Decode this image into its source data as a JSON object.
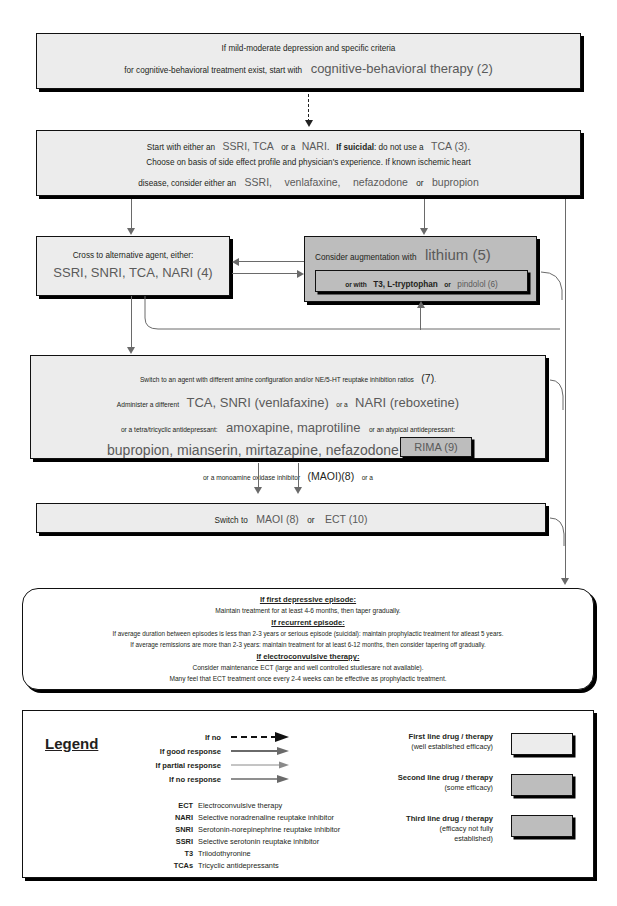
{
  "document": {
    "top_fragment": "",
    "title": "Algorithm for treatment of depression"
  },
  "nodes": {
    "cbt": {
      "id": "cbt-box",
      "tier": "first-line",
      "line1": "If mild-moderate depression and specific criteria",
      "line2_pre": "for cognitive-behavioral treatment exist, start with",
      "line2_emph": "cognitive-behavioral therapy (2)"
    },
    "start": {
      "id": "start-box",
      "tier": "first-line",
      "l1_a": "Start with either an",
      "l1_b": "SSRI, TCA",
      "l1_c": "or a",
      "l1_d": "NARI.",
      "l1_e": "If suicidal",
      "l1_f": ": do not use a",
      "l1_g": "TCA (3).",
      "l2": "Choose on basis of side effect profile and physician's experience. If known ischemic heart",
      "l3_a": "disease, consider either an",
      "l3_b": "SSRI,",
      "l3_c": "venlafaxine,",
      "l3_d": "nefazodone",
      "l3_e": "or",
      "l3_f": "bupropion"
    },
    "cross": {
      "id": "cross-box",
      "tier": "first-line",
      "l1": "Cross to alternative agent, either:",
      "l2": "SSRI, SNRI, TCA, NARI (4)"
    },
    "lithium": {
      "id": "lithium-box",
      "tier": "second-line",
      "l1_a": "Consider augmentation with",
      "l1_b": "lithium (5)",
      "inner": {
        "id": "lithium-inner-box",
        "tier": "third-line",
        "a": "or with",
        "b": "T3, L-tryptophan",
        "c": "or",
        "d": "pindolol (6)"
      }
    },
    "switch": {
      "id": "switch-box",
      "tier": "first-line",
      "l1_a": "Switch to an agent with different amine configuration and/or NE/5-HT reuptake inhibition ratios",
      "l1_b": "(7)",
      "l1_c": ".",
      "l2_a": "Administer a different",
      "l2_b": "TCA, SNRI (venlafaxine)",
      "l2_c": "or a",
      "l2_d": "NARI (reboxetine)",
      "l3_a": "or a tetra/tricyclic antidepressant:",
      "l3_b": "amoxapine, maprotiline",
      "l3_c": "or an atypical antidepressant:",
      "l4": "bupropion, mianserin, mirtazapine, nefazodone, trazodone",
      "l5_a": "or a monoamine oxidase inhibitor",
      "l5_b": "(MAOI)(8)",
      "l5_c": "or a",
      "rima": {
        "id": "rima-box",
        "tier": "second-line",
        "label": "RIMA (9)"
      }
    },
    "maoi_ect": {
      "id": "maoi-ect-box",
      "tier": "first-line",
      "a": "Switch to",
      "b": "MAOI (8)",
      "c": "or",
      "d": "ECT (10)"
    },
    "maintenance": {
      "id": "maintenance-box",
      "h1": "If first depressive episode:",
      "p1": "Maintain treatment for at least 4-6 months, then taper gradually.",
      "h2": "If recurrent episode:",
      "p2": "If average duration between episodes is less than 2-3 years or serious episode (suicidal): maintain prophylactic treatment for atleast 5 years.",
      "p3": "If average remissions are more than 2-3 years: maintain treatment for at least 6-12 months, then consider tapering off gradually.",
      "h3": "If electroconvulsive therapy:",
      "p4": "Consider maintenance ECT (large and well controlled studiesare not available).",
      "p5": "Many feel that ECT treatment once every 2-4 weeks can be effective as prophylactic treatment."
    }
  },
  "legend": {
    "title": "Legend",
    "responses": [
      {
        "label": "If no",
        "style": "dashed-thick"
      },
      {
        "label": "If good response",
        "style": "solid-thick"
      },
      {
        "label": "If partial response",
        "style": "solid-thin"
      },
      {
        "label": "If no response",
        "style": "solid-medium"
      }
    ],
    "abbreviations": [
      {
        "key": "ECT",
        "value": "Electroconvulsive therapy"
      },
      {
        "key": "NARI",
        "value": "Selective noradrenaline reuptake inhibitor"
      },
      {
        "key": "SNRI",
        "value": "Serotonin-norepinephrine reuptake inhibitor"
      },
      {
        "key": "SSRI",
        "value": "Selective serotonin reuptake inhibitor"
      },
      {
        "key": "T3",
        "value": "Triiodothyronine"
      },
      {
        "key": "TCAs",
        "value": "Tricyclic antidepressants"
      }
    ],
    "tiers": [
      {
        "name": "First  line drug / therapy",
        "note1": "(well established efficacy)",
        "note2": "",
        "color": "#ececec"
      },
      {
        "name": "Second line drug / therapy",
        "note1": "(some efficacy)",
        "note2": "",
        "color": "#bdbdbd"
      },
      {
        "name": "Third line drug / therapy",
        "note1": "(efficacy not fully",
        "note2": "established)",
        "color": "#bdbdbd"
      }
    ]
  },
  "colors": {
    "first_line": "#ececec",
    "second_line": "#bdbdbd",
    "third_line": "#bdbdbd",
    "line": "#6a6a6a",
    "text": "#231f20",
    "emphasis": "#5a5a5a"
  }
}
